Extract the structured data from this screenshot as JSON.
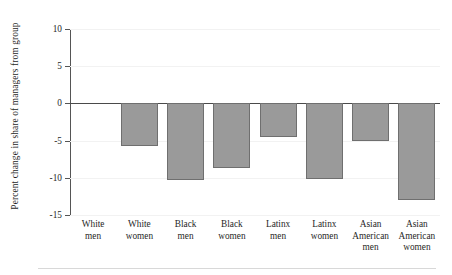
{
  "chart_data": {
    "type": "bar",
    "title": "",
    "subtitle": "",
    "xlabel": "",
    "ylabel": "Percent change in share of managers from group",
    "categories": [
      "White men",
      "White women",
      "Black men",
      "Black women",
      "Latinx men",
      "Latinx women",
      "Asian American men",
      "Asian American women"
    ],
    "category_lines": [
      [
        "White",
        "men"
      ],
      [
        "White",
        "women"
      ],
      [
        "Black",
        "men"
      ],
      [
        "Black",
        "women"
      ],
      [
        "Latinx",
        "men"
      ],
      [
        "Latinx",
        "women"
      ],
      [
        "Asian",
        "American",
        "men"
      ],
      [
        "Asian",
        "American",
        "women"
      ]
    ],
    "values": [
      0,
      -5.7,
      -10.3,
      -8.7,
      -4.5,
      -10.2,
      -5.1,
      -13.0
    ],
    "ylim": [
      -15,
      10
    ],
    "yticks": [
      10,
      5,
      0,
      -5,
      -10,
      -15
    ],
    "ytick_labels": [
      "10",
      "5",
      "0",
      "-5",
      "-10",
      "-15"
    ],
    "grid": true,
    "legend": "none",
    "bar_color": "#9a9a9a",
    "bar_edge_color": "#6f6f6f",
    "axis_color": "#555555",
    "zero_line_color": "#4a4a4a",
    "background_color": "#ffffff"
  }
}
